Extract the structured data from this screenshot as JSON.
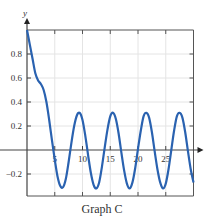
{
  "chart_data": {
    "type": "line",
    "title": "Graph C",
    "xlabel": "",
    "ylabel": "y",
    "xlim": [
      0,
      30
    ],
    "ylim": [
      -0.3,
      1.0
    ],
    "grid": true,
    "xticks": [
      5,
      10,
      15,
      20,
      25
    ],
    "xtick_labels": [
      "5",
      "10",
      "15",
      "20",
      "25"
    ],
    "yticks": [
      0.8,
      0.6,
      0.4,
      0.2,
      -0.2
    ],
    "ytick_labels": [
      "0.8",
      "0.6",
      "0.4",
      "0.2",
      "−0.2"
    ],
    "series": [
      {
        "name": "y",
        "color": "#2a62b0",
        "x": [
          0,
          0.5,
          1,
          1.5,
          2,
          2.5,
          3,
          3.5,
          4,
          4.5,
          5,
          5.5,
          6,
          6.5,
          7,
          7.5,
          8,
          8.5,
          9,
          9.5,
          10,
          10.5,
          11,
          11.5,
          12,
          12.5,
          13,
          13.5,
          14,
          14.5,
          15,
          15.5,
          16,
          16.5,
          17,
          17.5,
          18,
          18.5,
          19,
          19.5,
          20,
          20.5,
          21,
          21.5,
          22,
          22.5,
          23,
          23.5,
          24,
          24.5,
          25,
          25.5,
          26,
          26.5,
          27,
          27.5,
          28,
          28.5,
          29,
          29.5,
          30
        ],
        "y": [
          1.0,
          0.88,
          0.76,
          0.64,
          0.58,
          0.55,
          0.5,
          0.4,
          0.25,
          0.08,
          -0.08,
          -0.22,
          -0.3,
          -0.31,
          -0.24,
          -0.1,
          0.06,
          0.2,
          0.29,
          0.31,
          0.25,
          0.12,
          -0.04,
          -0.19,
          -0.29,
          -0.32,
          -0.27,
          -0.14,
          0.02,
          0.17,
          0.28,
          0.31,
          0.26,
          0.14,
          -0.02,
          -0.17,
          -0.28,
          -0.32,
          -0.27,
          -0.15,
          0.01,
          0.16,
          0.28,
          0.31,
          0.27,
          0.15,
          -0.01,
          -0.16,
          -0.27,
          -0.32,
          -0.28,
          -0.16,
          0.0,
          0.16,
          0.28,
          0.31,
          0.27,
          0.15,
          -0.01,
          -0.16,
          -0.27
        ]
      }
    ]
  }
}
